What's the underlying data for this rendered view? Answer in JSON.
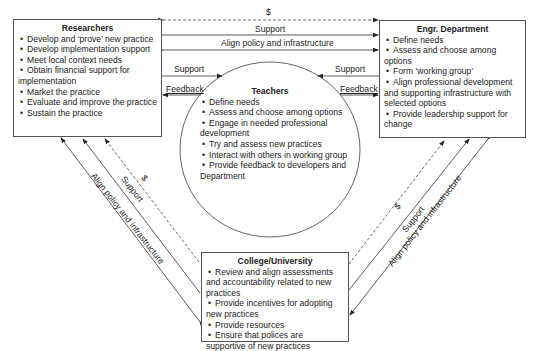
{
  "researchers": {
    "title": "Researchers",
    "items": [
      "Develop and ‘prove’ new practice",
      "Develop implementation support",
      "Meet local context needs",
      "Obtain financial support for implementation",
      "Market the practice",
      "Evaluate and improve the practice",
      "Sustain the practice"
    ]
  },
  "engr_department": {
    "title": "Engr. Department",
    "items": [
      "Define needs",
      "Assess and choose among options",
      "Form ‘working group’",
      "Align professional development and supporting infrastructure with selected options",
      "Provide leadership support for change"
    ]
  },
  "teachers": {
    "title": "Teachers",
    "items": [
      "Define needs",
      "Assess and choose among options",
      "Engage in needed professional development",
      "Try and assess new practices",
      "Interact with others in working group",
      "Provide feedback to developers and Department"
    ]
  },
  "college": {
    "title": "College/University",
    "items": [
      "Review and align assessments and accountability related to new practices",
      "Provide incentives for adopting new practices",
      "Provide resources",
      "Ensure that polices are supportive of new practices"
    ]
  },
  "connectors": {
    "top_dollar": "$",
    "top_support": "Support",
    "top_align": "Align policy and infrastructure",
    "left_support": "Support",
    "left_feedback": "Feedback",
    "right_support": "Support",
    "right_feedback": "Feedback",
    "left_diag_dollar": "$",
    "left_diag_support": "Support",
    "left_diag_align": "Align policy and infrastructure",
    "right_diag_dollar": "$",
    "right_diag_support": "Support",
    "right_diag_align": "Align policy and infrastructure"
  },
  "colors": {
    "line": "#333333",
    "border": "#555555",
    "text": "#222222"
  }
}
